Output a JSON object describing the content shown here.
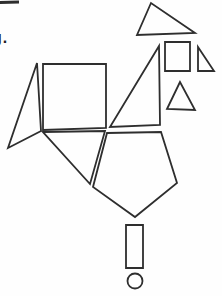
{
  "page": {
    "cropped_text": "g.",
    "background_color": "#fefefe"
  },
  "figure": {
    "stroke_color": "#2e2e2e",
    "stroke_width": 1.8,
    "shapes": [
      {
        "name": "top-rule-line",
        "type": "line",
        "x1": 0,
        "y1": 2.5,
        "x2": 19,
        "y2": 2,
        "stroke_width": 3
      },
      {
        "name": "top-triangle",
        "type": "polygon",
        "points": [
          [
            151,
            3
          ],
          [
            137,
            35
          ],
          [
            195,
            33
          ]
        ]
      },
      {
        "name": "small-square",
        "type": "polygon",
        "points": [
          [
            165,
            42
          ],
          [
            190,
            42
          ],
          [
            190,
            71
          ],
          [
            165,
            71
          ]
        ]
      },
      {
        "name": "small-right-triangle",
        "type": "polygon",
        "points": [
          [
            198,
            47
          ],
          [
            198,
            71
          ],
          [
            214,
            71
          ]
        ]
      },
      {
        "name": "small-isosceles-triangle",
        "type": "polygon",
        "points": [
          [
            180,
            82
          ],
          [
            167,
            109
          ],
          [
            195,
            110
          ]
        ]
      },
      {
        "name": "tall-right-triangle",
        "type": "polygon",
        "points": [
          [
            159,
            46
          ],
          [
            110,
            127
          ],
          [
            160,
            125
          ]
        ]
      },
      {
        "name": "large-square",
        "type": "polygon",
        "points": [
          [
            43,
            64
          ],
          [
            106,
            64
          ],
          [
            106,
            128
          ],
          [
            43,
            130
          ]
        ]
      },
      {
        "name": "left-sliver-triangle",
        "type": "polygon",
        "points": [
          [
            37,
            63
          ],
          [
            8,
            148
          ],
          [
            41,
            131
          ]
        ]
      },
      {
        "name": "lower-neck-triangle",
        "type": "polygon",
        "points": [
          [
            43,
            132
          ],
          [
            105,
            131
          ],
          [
            90,
            184
          ]
        ]
      },
      {
        "name": "pentagon-body",
        "type": "polygon",
        "points": [
          [
            107,
            133
          ],
          [
            161,
            132
          ],
          [
            177,
            183
          ],
          [
            135,
            217
          ],
          [
            93,
            187
          ]
        ]
      },
      {
        "name": "small-rectangle-leg",
        "type": "polygon",
        "points": [
          [
            126,
            225
          ],
          [
            143,
            225
          ],
          [
            143,
            268
          ],
          [
            126,
            268
          ]
        ]
      },
      {
        "name": "bottom-circle",
        "type": "circle",
        "cx": 135,
        "cy": 281,
        "r": 7.5
      }
    ]
  }
}
